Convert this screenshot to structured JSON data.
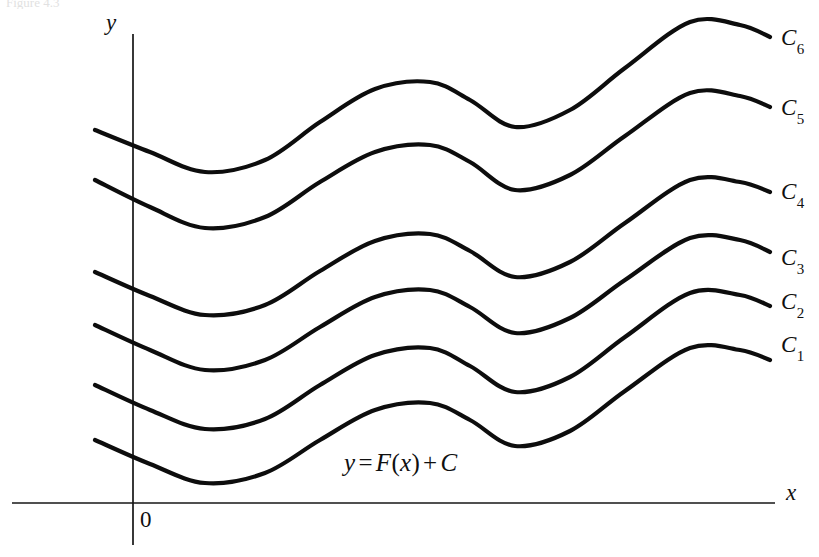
{
  "figure": {
    "background_color": "#ffffff",
    "ink_color": "#0d0d0d",
    "axis_color": "#161616",
    "faint_header_text": "Figure 4.3",
    "axes": {
      "y_axis_label": "y",
      "x_axis_label": "x",
      "origin_label": "0"
    },
    "equation": {
      "lhs": "y",
      "equals": "=",
      "func_name": "F",
      "open_paren": "(",
      "variable": "x",
      "close_paren": ")",
      "plus": "+",
      "constant": "C",
      "full_text": "y = F(x) + C"
    },
    "curves": [
      {
        "base": "C",
        "sub": "6",
        "label": "C6"
      },
      {
        "base": "C",
        "sub": "5",
        "label": "C5"
      },
      {
        "base": "C",
        "sub": "4",
        "label": "C4"
      },
      {
        "base": "C",
        "sub": "3",
        "label": "C3"
      },
      {
        "base": "C",
        "sub": "2",
        "label": "C2"
      },
      {
        "base": "C",
        "sub": "1",
        "label": "C1"
      }
    ]
  },
  "chart_data": {
    "type": "line",
    "title": "",
    "xlabel": "x",
    "ylabel": "y",
    "grid": false,
    "legend": "right-inline",
    "xlim": [
      0,
      819
    ],
    "ylim": [
      0,
      557
    ],
    "x_samples": [
      95,
      150,
      205,
      265,
      320,
      375,
      430,
      470,
      515,
      570,
      625,
      690,
      740,
      770
    ],
    "series": [
      {
        "name": "C6",
        "label_position": [
          781,
          38
        ],
        "values": [
          130,
          152,
          172,
          160,
          122,
          89,
          82,
          100,
          127,
          110,
          68,
          22,
          25,
          37
        ]
      },
      {
        "name": "C5",
        "label_position": [
          781,
          108
        ],
        "values": [
          180,
          207,
          228,
          217,
          182,
          152,
          145,
          162,
          190,
          175,
          136,
          93,
          96,
          107
        ]
      },
      {
        "name": "C4",
        "label_position": [
          781,
          192
        ],
        "values": [
          272,
          296,
          315,
          305,
          271,
          241,
          234,
          251,
          277,
          262,
          223,
          180,
          182,
          192
        ]
      },
      {
        "name": "C3",
        "label_position": [
          781,
          258
        ],
        "values": [
          325,
          350,
          370,
          360,
          327,
          297,
          290,
          307,
          333,
          318,
          280,
          238,
          240,
          252
        ]
      },
      {
        "name": "C2",
        "label_position": [
          781,
          302
        ],
        "values": [
          385,
          410,
          429,
          419,
          385,
          355,
          348,
          366,
          392,
          377,
          337,
          293,
          295,
          306
        ]
      },
      {
        "name": "C1",
        "label_position": [
          781,
          345
        ],
        "values": [
          440,
          464,
          483,
          473,
          440,
          410,
          403,
          420,
          446,
          431,
          391,
          348,
          350,
          360
        ]
      }
    ],
    "annotations": [
      {
        "text": "y = F(x) + C",
        "x": 345,
        "y": 466
      },
      {
        "text": "0",
        "x": 141,
        "y": 523
      }
    ],
    "axis_geometry": {
      "y_axis_x": 133,
      "y_axis_top": 34,
      "y_axis_bottom": 545,
      "x_axis_y": 503,
      "x_axis_left": 12,
      "x_axis_right": 775
    }
  }
}
